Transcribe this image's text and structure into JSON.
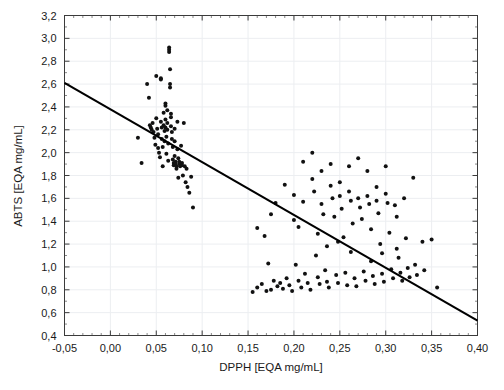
{
  "chart_data": {
    "type": "scatter",
    "title": "",
    "xlabel": "DPPH [EQA mg/mL]",
    "ylabel": "ABTS [EQA mg/mL]",
    "xlim": [
      -0.05,
      0.4
    ],
    "ylim": [
      0.4,
      3.2
    ],
    "xticks": [
      -0.05,
      0.0,
      0.05,
      0.1,
      0.15,
      0.2,
      0.25,
      0.3,
      0.35,
      0.4
    ],
    "yticks": [
      0.4,
      0.6,
      0.8,
      1.0,
      1.2,
      1.4,
      1.6,
      1.8,
      2.0,
      2.2,
      2.4,
      2.6,
      2.8,
      3.0,
      3.2
    ],
    "xtick_labels": [
      "-0,05",
      "0,00",
      "0,05",
      "0,10",
      "0,15",
      "0,20",
      "0,25",
      "0,30",
      "0,35",
      "0,40"
    ],
    "ytick_labels": [
      "0,4",
      "0,6",
      "0,8",
      "1,0",
      "1,2",
      "1,4",
      "1,6",
      "1,8",
      "2,0",
      "2,2",
      "2,4",
      "2,6",
      "2,8",
      "3,0",
      "3,2"
    ],
    "decimal_separator": ",",
    "grid": true,
    "grid_color": "#eceef1",
    "legend": false,
    "marker": "filled-circle",
    "marker_color": "#111111",
    "marker_size_px": 3.0,
    "minor_ticks": true,
    "frame_color": "#3b3b3b",
    "series": [
      {
        "name": "samples",
        "points": [
          [
            0.03,
            2.13
          ],
          [
            0.034,
            1.91
          ],
          [
            0.04,
            2.6
          ],
          [
            0.042,
            2.48
          ],
          [
            0.043,
            2.24
          ],
          [
            0.044,
            2.22
          ],
          [
            0.045,
            2.2
          ],
          [
            0.046,
            2.26
          ],
          [
            0.047,
            2.18
          ],
          [
            0.048,
            2.13
          ],
          [
            0.049,
            2.07
          ],
          [
            0.05,
            2.67
          ],
          [
            0.05,
            2.3
          ],
          [
            0.051,
            2.21
          ],
          [
            0.052,
            2.16
          ],
          [
            0.052,
            2.04
          ],
          [
            0.053,
            2.0
          ],
          [
            0.054,
            1.96
          ],
          [
            0.055,
            2.65
          ],
          [
            0.055,
            2.64
          ],
          [
            0.055,
            2.27
          ],
          [
            0.056,
            2.22
          ],
          [
            0.056,
            2.12
          ],
          [
            0.057,
            2.05
          ],
          [
            0.057,
            1.88
          ],
          [
            0.058,
            2.35
          ],
          [
            0.058,
            2.24
          ],
          [
            0.059,
            2.19
          ],
          [
            0.059,
            2.1
          ],
          [
            0.06,
            2.43
          ],
          [
            0.06,
            2.41
          ],
          [
            0.06,
            2.29
          ],
          [
            0.06,
            2.22
          ],
          [
            0.061,
            2.14
          ],
          [
            0.061,
            1.99
          ],
          [
            0.062,
            2.37
          ],
          [
            0.062,
            2.26
          ],
          [
            0.062,
            2.2
          ],
          [
            0.063,
            2.08
          ],
          [
            0.063,
            1.93
          ],
          [
            0.064,
            2.92
          ],
          [
            0.064,
            2.9
          ],
          [
            0.064,
            2.88
          ],
          [
            0.065,
            2.73
          ],
          [
            0.065,
            2.6
          ],
          [
            0.065,
            2.57
          ],
          [
            0.066,
            2.34
          ],
          [
            0.066,
            2.31
          ],
          [
            0.066,
            2.23
          ],
          [
            0.067,
            2.18
          ],
          [
            0.067,
            2.12
          ],
          [
            0.068,
            2.05
          ],
          [
            0.068,
            1.94
          ],
          [
            0.069,
            1.91
          ],
          [
            0.069,
            1.89
          ],
          [
            0.07,
            2.21
          ],
          [
            0.07,
            2.1
          ],
          [
            0.07,
            1.97
          ],
          [
            0.071,
            1.92
          ],
          [
            0.071,
            1.9
          ],
          [
            0.072,
            1.88
          ],
          [
            0.072,
            1.86
          ],
          [
            0.073,
            2.27
          ],
          [
            0.073,
            2.03
          ],
          [
            0.074,
            1.95
          ],
          [
            0.074,
            1.78
          ],
          [
            0.075,
            1.92
          ],
          [
            0.075,
            1.9
          ],
          [
            0.076,
            1.88
          ],
          [
            0.077,
            2.06
          ],
          [
            0.078,
            1.91
          ],
          [
            0.078,
            1.89
          ],
          [
            0.079,
            1.8
          ],
          [
            0.08,
            2.26
          ],
          [
            0.081,
            1.88
          ],
          [
            0.082,
            1.74
          ],
          [
            0.083,
            1.86
          ],
          [
            0.084,
            1.7
          ],
          [
            0.086,
            1.65
          ],
          [
            0.088,
            1.79
          ],
          [
            0.09,
            1.52
          ],
          [
            0.155,
            0.78
          ],
          [
            0.16,
            0.82
          ],
          [
            0.165,
            0.85
          ],
          [
            0.168,
            1.27
          ],
          [
            0.17,
            0.79
          ],
          [
            0.172,
            1.03
          ],
          [
            0.175,
            0.8
          ],
          [
            0.178,
            0.88
          ],
          [
            0.18,
            1.56
          ],
          [
            0.182,
            0.83
          ],
          [
            0.185,
            0.86
          ],
          [
            0.188,
            0.81
          ],
          [
            0.19,
            1.72
          ],
          [
            0.192,
            0.9
          ],
          [
            0.195,
            0.84
          ],
          [
            0.198,
            0.79
          ],
          [
            0.2,
            1.63
          ],
          [
            0.2,
            1.41
          ],
          [
            0.202,
            1.02
          ],
          [
            0.205,
            0.88
          ],
          [
            0.208,
            0.82
          ],
          [
            0.21,
            1.92
          ],
          [
            0.21,
            1.57
          ],
          [
            0.212,
            0.94
          ],
          [
            0.215,
            0.86
          ],
          [
            0.218,
            0.8
          ],
          [
            0.22,
            2.0
          ],
          [
            0.22,
            1.77
          ],
          [
            0.222,
            1.66
          ],
          [
            0.224,
            1.1
          ],
          [
            0.226,
            0.91
          ],
          [
            0.228,
            0.85
          ],
          [
            0.23,
            1.84
          ],
          [
            0.23,
            1.55
          ],
          [
            0.232,
            1.46
          ],
          [
            0.234,
            0.97
          ],
          [
            0.236,
            0.87
          ],
          [
            0.238,
            0.82
          ],
          [
            0.24,
            1.9
          ],
          [
            0.24,
            1.71
          ],
          [
            0.242,
            1.6
          ],
          [
            0.244,
            1.44
          ],
          [
            0.246,
            0.93
          ],
          [
            0.248,
            0.86
          ],
          [
            0.25,
            1.74
          ],
          [
            0.25,
            1.62
          ],
          [
            0.252,
            1.51
          ],
          [
            0.254,
            1.26
          ],
          [
            0.256,
            0.95
          ],
          [
            0.258,
            0.84
          ],
          [
            0.26,
            1.88
          ],
          [
            0.26,
            1.66
          ],
          [
            0.262,
            1.58
          ],
          [
            0.264,
            1.38
          ],
          [
            0.266,
            0.9
          ],
          [
            0.268,
            0.83
          ],
          [
            0.27,
            1.95
          ],
          [
            0.27,
            1.6
          ],
          [
            0.272,
            1.52
          ],
          [
            0.274,
            1.42
          ],
          [
            0.276,
            0.96
          ],
          [
            0.278,
            0.88
          ],
          [
            0.28,
            1.84
          ],
          [
            0.28,
            1.62
          ],
          [
            0.282,
            1.55
          ],
          [
            0.284,
            1.33
          ],
          [
            0.286,
            0.92
          ],
          [
            0.288,
            0.85
          ],
          [
            0.29,
            1.7
          ],
          [
            0.29,
            1.58
          ],
          [
            0.292,
            1.47
          ],
          [
            0.294,
            1.2
          ],
          [
            0.296,
            0.94
          ],
          [
            0.298,
            0.87
          ],
          [
            0.3,
            1.88
          ],
          [
            0.3,
            1.64
          ],
          [
            0.302,
            1.56
          ],
          [
            0.304,
            1.3
          ],
          [
            0.306,
            0.98
          ],
          [
            0.308,
            0.9
          ],
          [
            0.31,
            1.54
          ],
          [
            0.312,
            1.44
          ],
          [
            0.314,
            1.08
          ],
          [
            0.316,
            0.95
          ],
          [
            0.318,
            0.88
          ],
          [
            0.32,
            1.6
          ],
          [
            0.322,
            1.25
          ],
          [
            0.324,
            0.99
          ],
          [
            0.326,
            0.91
          ],
          [
            0.33,
            1.78
          ],
          [
            0.332,
            1.02
          ],
          [
            0.334,
            0.93
          ],
          [
            0.34,
            1.22
          ],
          [
            0.342,
            0.97
          ],
          [
            0.35,
            1.24
          ],
          [
            0.356,
            0.82
          ],
          [
            0.16,
            1.34
          ],
          [
            0.175,
            1.46
          ],
          [
            0.205,
            1.35
          ],
          [
            0.236,
            1.18
          ],
          [
            0.262,
            1.13
          ],
          [
            0.284,
            1.05
          ],
          [
            0.226,
            1.29
          ],
          [
            0.248,
            1.22
          ],
          [
            0.296,
            1.12
          ],
          [
            0.312,
            1.16
          ]
        ]
      }
    ],
    "trendline": {
      "type": "linear-fit",
      "x_start": -0.05,
      "y_start": 2.61,
      "x_end": 0.4,
      "y_end": 0.53,
      "color": "#000000"
    }
  }
}
